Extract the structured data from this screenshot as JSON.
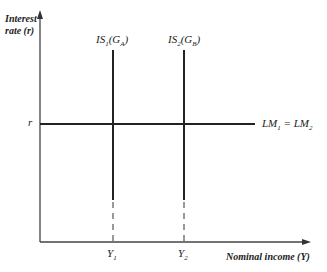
{
  "diagram": {
    "type": "IS-LM diagram",
    "y_axis": {
      "label_line1": "Interest",
      "label_line2": "rate (r)"
    },
    "x_axis": {
      "label": "Nominal income (Y)"
    },
    "interest_level": {
      "label": "r"
    },
    "curves": {
      "lm": {
        "label": "LM",
        "sub1": "1",
        "eq": " = LM",
        "sub2": "2",
        "orientation": "horizontal"
      },
      "is1": {
        "prefix": "IS",
        "sub": "1",
        "open": "(G",
        "gsub": "A",
        "close": ")",
        "orientation": "vertical"
      },
      "is2": {
        "prefix": "IS",
        "sub": "2",
        "open": "(G",
        "gsub": "B",
        "close": ")",
        "orientation": "vertical"
      }
    },
    "x_ticks": [
      {
        "label": "Y",
        "sub": "1"
      },
      {
        "label": "Y",
        "sub": "2"
      }
    ],
    "colors": {
      "line": "#222222",
      "axis": "#444444",
      "background": "#ffffff"
    }
  }
}
